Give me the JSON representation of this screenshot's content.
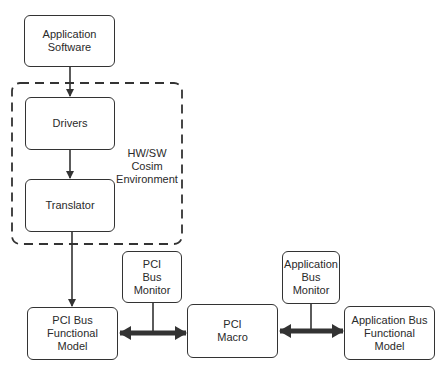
{
  "diagram": {
    "nodes": {
      "app_software": {
        "label": "Application\nSoftware"
      },
      "drivers": {
        "label": "Drivers"
      },
      "translator": {
        "label": "Translator"
      },
      "pci_bfm": {
        "label": "PCI Bus\nFunctional\nModel"
      },
      "pci_bus_monitor": {
        "label": "PCI\nBus\nMonitor"
      },
      "pci_macro": {
        "label": "PCI\nMacro"
      },
      "app_bus_monitor": {
        "label": "Application\nBus\nMonitor"
      },
      "app_bfm": {
        "label": "Application Bus\nFunctional\nModel"
      }
    },
    "group": {
      "label": "HW/SW\nCosim\nEnvironment",
      "style": "dashed"
    },
    "edges": [
      {
        "from": "app_software",
        "to": "drivers",
        "type": "arrow"
      },
      {
        "from": "drivers",
        "to": "translator",
        "type": "arrow"
      },
      {
        "from": "translator",
        "to": "pci_bfm",
        "type": "arrow"
      },
      {
        "from": "pci_bfm",
        "to": "pci_macro",
        "type": "bidirectional-bus",
        "monitor": "pci_bus_monitor"
      },
      {
        "from": "pci_macro",
        "to": "app_bfm",
        "type": "bidirectional-bus",
        "monitor": "app_bus_monitor"
      }
    ],
    "colors": {
      "stroke": "#333333",
      "background": "#ffffff"
    }
  }
}
